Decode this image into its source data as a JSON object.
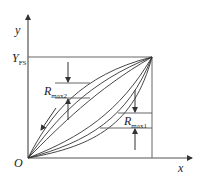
{
  "diagram": {
    "axes": {
      "x_label": "x",
      "y_label": "y",
      "origin_label": "O",
      "y_fullscale_label": "Y",
      "y_fullscale_subscript": "FS"
    },
    "annotations": [
      {
        "id": "rmax2",
        "label": "R",
        "subscript": "max2"
      },
      {
        "id": "rmax1",
        "label": "R",
        "subscript": "max1"
      }
    ],
    "curves": {
      "count": 6,
      "description": "Loading (upper) and unloading (lower) characteristic curves from origin to full-scale point"
    },
    "colors": {
      "stroke": "#333333",
      "background": "#ffffff"
    }
  }
}
